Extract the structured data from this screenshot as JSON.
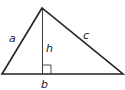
{
  "diagram": {
    "labels": {
      "a": "a",
      "b": "b",
      "c": "c",
      "h": "h"
    },
    "colors": {
      "stroke": "#222222",
      "background": "#ffffff"
    }
  }
}
